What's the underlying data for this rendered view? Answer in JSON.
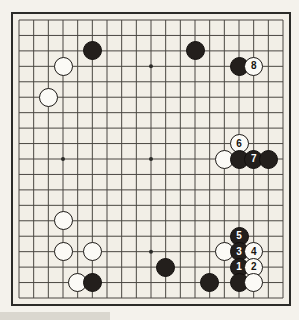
{
  "diagram": {
    "kind": "go-board-diagram",
    "board_size": 19,
    "board_color": "#f2efe7",
    "line_color": "#4a4742",
    "border_color": "#2b2b28",
    "black_color": "#231f1c",
    "white_color": "#fbfaf6",
    "star_points": [
      {
        "col": 3,
        "row": 3
      },
      {
        "col": 9,
        "row": 3
      },
      {
        "col": 15,
        "row": 3
      },
      {
        "col": 3,
        "row": 9
      },
      {
        "col": 9,
        "row": 9
      },
      {
        "col": 15,
        "row": 9
      },
      {
        "col": 3,
        "row": 15
      },
      {
        "col": 9,
        "row": 15
      },
      {
        "col": 15,
        "row": 15
      }
    ],
    "stones": [
      {
        "id": "b-top-left",
        "color": "black",
        "col": 5,
        "row": 2,
        "label": ""
      },
      {
        "id": "b-top-center",
        "color": "black",
        "col": 12,
        "row": 2,
        "label": ""
      },
      {
        "id": "b-top-right",
        "color": "black",
        "col": 15,
        "row": 3,
        "label": ""
      },
      {
        "id": "w-move-8",
        "color": "white",
        "col": 16,
        "row": 3,
        "label": "8"
      },
      {
        "id": "w-upper-left-1",
        "color": "white",
        "col": 3,
        "row": 3,
        "label": ""
      },
      {
        "id": "w-upper-left-2",
        "color": "white",
        "col": 2,
        "row": 5,
        "label": ""
      },
      {
        "id": "w-move-6",
        "color": "white",
        "col": 15,
        "row": 8,
        "label": "6"
      },
      {
        "id": "w-right-side",
        "color": "white",
        "col": 14,
        "row": 9,
        "label": ""
      },
      {
        "id": "b-right-1",
        "color": "black",
        "col": 15,
        "row": 9,
        "label": ""
      },
      {
        "id": "b-move-7",
        "color": "black",
        "col": 16,
        "row": 9,
        "label": "7"
      },
      {
        "id": "b-right-2",
        "color": "black",
        "col": 17,
        "row": 9,
        "label": ""
      },
      {
        "id": "w-lower-left-1",
        "color": "white",
        "col": 3,
        "row": 13,
        "label": ""
      },
      {
        "id": "w-lower-left-2",
        "color": "white",
        "col": 3,
        "row": 15,
        "label": ""
      },
      {
        "id": "w-lower-left-3",
        "color": "white",
        "col": 5,
        "row": 15,
        "label": ""
      },
      {
        "id": "w-lower-left-4",
        "color": "white",
        "col": 4,
        "row": 17,
        "label": ""
      },
      {
        "id": "b-lower-left",
        "color": "black",
        "col": 5,
        "row": 17,
        "label": ""
      },
      {
        "id": "b-bottom-center",
        "color": "black",
        "col": 10,
        "row": 16,
        "label": ""
      },
      {
        "id": "b-bottom-right",
        "color": "black",
        "col": 13,
        "row": 17,
        "label": ""
      },
      {
        "id": "b-move-5",
        "color": "black",
        "col": 15,
        "row": 14,
        "label": "5"
      },
      {
        "id": "w-lower-right-1",
        "color": "white",
        "col": 14,
        "row": 15,
        "label": ""
      },
      {
        "id": "b-move-3",
        "color": "black",
        "col": 15,
        "row": 15,
        "label": "3"
      },
      {
        "id": "w-move-4",
        "color": "white",
        "col": 16,
        "row": 15,
        "label": "4"
      },
      {
        "id": "b-move-1",
        "color": "black",
        "col": 15,
        "row": 16,
        "label": "1"
      },
      {
        "id": "w-move-2",
        "color": "white",
        "col": 16,
        "row": 16,
        "label": "2"
      },
      {
        "id": "b-corner",
        "color": "black",
        "col": 15,
        "row": 17,
        "label": ""
      },
      {
        "id": "w-corner",
        "color": "white",
        "col": 16,
        "row": 17,
        "label": ""
      }
    ]
  }
}
